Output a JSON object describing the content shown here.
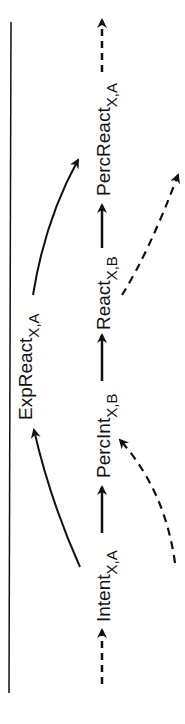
{
  "diagram": {
    "orientation": "rotated-90-ccw",
    "nodes": [
      {
        "id": "intent",
        "label": "Intent",
        "subscript": "X,A"
      },
      {
        "id": "percint",
        "label": "PercInt",
        "subscript": "X,B"
      },
      {
        "id": "react",
        "label": "React",
        "subscript": "X,B"
      },
      {
        "id": "percreact",
        "label": "PercReact",
        "subscript": "X,A"
      },
      {
        "id": "expreact",
        "label": "ExpReact",
        "subscript": "X,A"
      }
    ],
    "edges": [
      {
        "from": "input",
        "to": "intent",
        "style": "dashed"
      },
      {
        "from": "intent",
        "to": "percint",
        "style": "solid"
      },
      {
        "from": "percint",
        "to": "react",
        "style": "solid"
      },
      {
        "from": "react",
        "to": "percreact",
        "style": "solid"
      },
      {
        "from": "percreact",
        "to": "output",
        "style": "dashed"
      },
      {
        "from": "intent",
        "to": "expreact",
        "style": "solid-curved"
      },
      {
        "from": "expreact",
        "to": "percreact",
        "style": "solid-curved"
      },
      {
        "from": "external",
        "to": "percint",
        "style": "dashed-curved"
      },
      {
        "from": "react",
        "to": "external",
        "style": "dashed-curved"
      }
    ],
    "colors": {
      "stroke": "#111111",
      "background": "#ffffff"
    }
  }
}
